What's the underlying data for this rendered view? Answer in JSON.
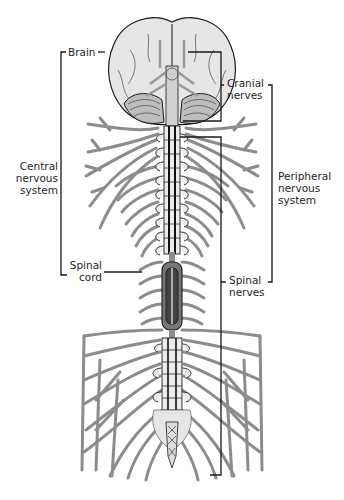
{
  "diagram": {
    "colors": {
      "nerve": "#8c8c8c",
      "brain_fill": "#e6e6e6",
      "outline": "#1a1a1a",
      "spinal_cord_dark": "#555555",
      "bracket": "#1a1a1a",
      "background": "#ffffff"
    },
    "labels": {
      "brain": "Brain",
      "central": [
        "Central",
        "nervous",
        "system"
      ],
      "spinal_cord": [
        "Spinal",
        "cord"
      ],
      "cranial": [
        "Cranial",
        "nerves"
      ],
      "peripheral": [
        "Peripheral",
        "nervous",
        "system"
      ],
      "spinal_nerves": [
        "Spinal",
        "nerves"
      ]
    },
    "groupings": [
      {
        "name": "Central nervous system",
        "members": [
          "Brain",
          "Spinal cord"
        ]
      },
      {
        "name": "Peripheral nervous system",
        "members": [
          "Cranial nerves",
          "Spinal nerves"
        ]
      }
    ]
  }
}
